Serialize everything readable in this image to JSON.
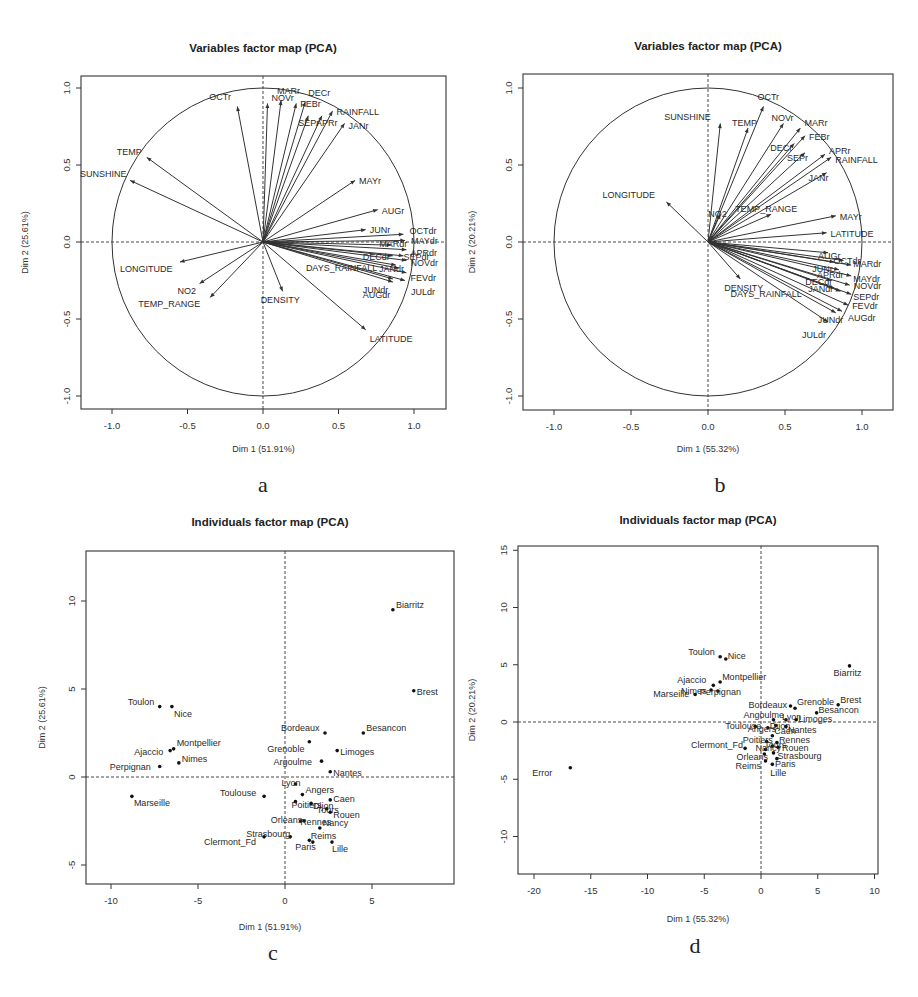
{
  "panels": {
    "a": {
      "letter": "a",
      "title": "Variables factor map (PCA)",
      "xlabel": "Dim 1 (51.91%)",
      "ylabel": "Dim 2 (25.61%)"
    },
    "b": {
      "letter": "b",
      "title": "Variables factor map (PCA)",
      "xlabel": "Dim 1 (55.32%)",
      "ylabel": "Dim 2 (20.21%)"
    },
    "c": {
      "letter": "c",
      "title": "Individuals factor map (PCA)",
      "xlabel": "Dim 1 (51.91%)",
      "ylabel": "Dim 2 (25.61%)"
    },
    "d": {
      "letter": "d",
      "title": "Individuals factor map (PCA)",
      "xlabel": "Dim 1 (55.32%)",
      "ylabel": "Dim 2 (20.21%)"
    }
  },
  "chart_data": [
    {
      "id": "a",
      "type": "scatter",
      "subtype": "variables-correlation-circle",
      "title": "Variables factor map (PCA)",
      "xlabel": "Dim 1 (51.91%)",
      "ylabel": "Dim 2 (25.61%)",
      "xlim": [
        -1.2,
        1.2
      ],
      "ylim": [
        -1.05,
        1.05
      ],
      "xticks": [
        "-1.0",
        "-0.5",
        "0.0",
        "0.5",
        "1.0"
      ],
      "yticks": [
        "-1.0",
        "-0.5",
        "0.0",
        "0.5",
        "1.0"
      ],
      "grid": false,
      "legend": null,
      "points": [
        {
          "label": "OCTr",
          "x": -0.17,
          "y": 0.88
        },
        {
          "label": "NOVr",
          "x": 0.03,
          "y": 0.9
        },
        {
          "label": "MARr",
          "x": 0.12,
          "y": 0.92
        },
        {
          "label": "FEBr",
          "x": 0.22,
          "y": 0.9
        },
        {
          "label": "DECr",
          "x": 0.28,
          "y": 0.91
        },
        {
          "label": "SEPr",
          "x": 0.3,
          "y": 0.82
        },
        {
          "label": "APRr",
          "x": 0.39,
          "y": 0.82
        },
        {
          "label": "RAINFALL",
          "x": 0.46,
          "y": 0.85
        },
        {
          "label": "JANr",
          "x": 0.54,
          "y": 0.77
        },
        {
          "label": "TEMP",
          "x": -0.77,
          "y": 0.55
        },
        {
          "label": "SUNSHINE",
          "x": -0.88,
          "y": 0.4
        },
        {
          "label": "MAYr",
          "x": 0.61,
          "y": 0.4
        },
        {
          "label": "AUGr",
          "x": 0.76,
          "y": 0.21
        },
        {
          "label": "JUNr",
          "x": 0.68,
          "y": 0.08
        },
        {
          "label": "OCTdr",
          "x": 0.93,
          "y": 0.05
        },
        {
          "label": "MAYdr",
          "x": 0.94,
          "y": 0.01
        },
        {
          "label": "MARdr",
          "x": 0.85,
          "y": -0.02
        },
        {
          "label": "APRdr",
          "x": 0.95,
          "y": -0.05
        },
        {
          "label": "DECdr",
          "x": 0.86,
          "y": -0.09
        },
        {
          "label": "SEPdr",
          "x": 0.93,
          "y": -0.09
        },
        {
          "label": "NOVdr",
          "x": 0.95,
          "y": -0.12
        },
        {
          "label": "DAYS_RAINFALL",
          "x": 0.88,
          "y": -0.15
        },
        {
          "label": "JANdr",
          "x": 0.9,
          "y": -0.17
        },
        {
          "label": "FEVdr",
          "x": 0.95,
          "y": -0.2
        },
        {
          "label": "JUNdr",
          "x": 0.86,
          "y": -0.24
        },
        {
          "label": "AUGdr",
          "x": 0.86,
          "y": -0.26
        },
        {
          "label": "JULdr",
          "x": 0.94,
          "y": -0.25
        },
        {
          "label": "LONGITUDE",
          "x": -0.55,
          "y": -0.13
        },
        {
          "label": "NO2",
          "x": -0.42,
          "y": -0.27
        },
        {
          "label": "TEMP_RANGE",
          "x": -0.35,
          "y": -0.36
        },
        {
          "label": "DENSITY",
          "x": 0.13,
          "y": -0.32
        },
        {
          "label": "LATITUDE",
          "x": 0.68,
          "y": -0.57
        }
      ]
    },
    {
      "id": "b",
      "type": "scatter",
      "subtype": "variables-correlation-circle",
      "title": "Variables factor map (PCA)",
      "xlabel": "Dim 1 (55.32%)",
      "ylabel": "Dim 2 (20.21%)",
      "xlim": [
        -1.2,
        1.2
      ],
      "ylim": [
        -1.05,
        1.05
      ],
      "xticks": [
        "-1.0",
        "-0.5",
        "0.0",
        "0.5",
        "1.0"
      ],
      "yticks": [
        "-1.0",
        "-0.5",
        "0.0",
        "0.5",
        "1.0"
      ],
      "grid": false,
      "legend": null,
      "points": [
        {
          "label": "OCTr",
          "x": 0.36,
          "y": 0.88
        },
        {
          "label": "SUNSHINE",
          "x": 0.08,
          "y": 0.77
        },
        {
          "label": "TEMP",
          "x": 0.26,
          "y": 0.74
        },
        {
          "label": "NOVr",
          "x": 0.49,
          "y": 0.77
        },
        {
          "label": "MARr",
          "x": 0.6,
          "y": 0.74
        },
        {
          "label": "FEBr",
          "x": 0.63,
          "y": 0.69
        },
        {
          "label": "DECr",
          "x": 0.56,
          "y": 0.64
        },
        {
          "label": "SEPr",
          "x": 0.63,
          "y": 0.58
        },
        {
          "label": "APRr",
          "x": 0.76,
          "y": 0.57
        },
        {
          "label": "RAINFALL",
          "x": 0.8,
          "y": 0.55
        },
        {
          "label": "JANr",
          "x": 0.77,
          "y": 0.45
        },
        {
          "label": "LONGITUDE",
          "x": -0.27,
          "y": 0.26
        },
        {
          "label": "NO2",
          "x": 0.08,
          "y": 0.18
        },
        {
          "label": "TEMP_RANGE",
          "x": 0.41,
          "y": 0.18
        },
        {
          "label": "MAYr",
          "x": 0.83,
          "y": 0.17
        },
        {
          "label": "LATITUDE",
          "x": 0.77,
          "y": 0.06
        },
        {
          "label": "AUGr",
          "x": 0.78,
          "y": -0.07
        },
        {
          "label": "JUNr",
          "x": 0.82,
          "y": -0.13
        },
        {
          "label": "OCTdr",
          "x": 0.88,
          "y": -0.12
        },
        {
          "label": "MARdr",
          "x": 0.93,
          "y": -0.15
        },
        {
          "label": "APRdr",
          "x": 0.85,
          "y": -0.18
        },
        {
          "label": "MAYdr",
          "x": 0.93,
          "y": -0.22
        },
        {
          "label": "DECdr",
          "x": 0.8,
          "y": -0.25
        },
        {
          "label": "NOVdr",
          "x": 0.92,
          "y": -0.28
        },
        {
          "label": "JANdr",
          "x": 0.82,
          "y": -0.3
        },
        {
          "label": "DAYS_RAINFALL",
          "x": 0.86,
          "y": -0.32
        },
        {
          "label": "SEPdr",
          "x": 0.93,
          "y": -0.34
        },
        {
          "label": "FEVdr",
          "x": 0.91,
          "y": -0.41
        },
        {
          "label": "JUNdr",
          "x": 0.83,
          "y": -0.46
        },
        {
          "label": "AUGdr",
          "x": 0.87,
          "y": -0.45
        },
        {
          "label": "JULdr",
          "x": 0.78,
          "y": -0.52
        },
        {
          "label": "DENSITY",
          "x": 0.21,
          "y": -0.24
        }
      ]
    },
    {
      "id": "c",
      "type": "scatter",
      "subtype": "individuals-map",
      "title": "Individuals factor map (PCA)",
      "xlabel": "Dim 1 (51.91%)",
      "ylabel": "Dim 2 (25.61%)",
      "xlim": [
        -11.5,
        9.5
      ],
      "ylim": [
        -6.2,
        12.8
      ],
      "xticks": [
        "-10",
        "-5",
        "0",
        "5"
      ],
      "yticks": [
        "-5",
        "0",
        "5",
        "10"
      ],
      "grid": false,
      "legend": null,
      "points": [
        {
          "label": "Biarritz",
          "x": 6.2,
          "y": 9.5
        },
        {
          "label": "Brest",
          "x": 7.4,
          "y": 4.9
        },
        {
          "label": "Toulon",
          "x": -7.2,
          "y": 4.0
        },
        {
          "label": "Nice",
          "x": -6.5,
          "y": 4.0
        },
        {
          "label": "Bordeaux",
          "x": 2.3,
          "y": 2.5
        },
        {
          "label": "Besancon",
          "x": 4.5,
          "y": 2.5
        },
        {
          "label": "Grenoble",
          "x": 1.4,
          "y": 2.0
        },
        {
          "label": "Montpellier",
          "x": -6.4,
          "y": 1.6
        },
        {
          "label": "Ajaccio",
          "x": -6.6,
          "y": 1.5
        },
        {
          "label": "Limoges",
          "x": 3.0,
          "y": 1.5
        },
        {
          "label": "Nimes",
          "x": -6.1,
          "y": 0.8
        },
        {
          "label": "Argoulme",
          "x": 2.1,
          "y": 0.9
        },
        {
          "label": "Perpignan",
          "x": -7.2,
          "y": 0.6
        },
        {
          "label": "Nantes",
          "x": 2.6,
          "y": 0.3
        },
        {
          "label": "Lyon",
          "x": 0.6,
          "y": -0.4
        },
        {
          "label": "Angers",
          "x": 1.0,
          "y": -1.0
        },
        {
          "label": "Marseille",
          "x": -8.8,
          "y": -1.1
        },
        {
          "label": "Toulouse",
          "x": -1.2,
          "y": -1.1
        },
        {
          "label": "Caen",
          "x": 2.6,
          "y": -1.3
        },
        {
          "label": "Poitiers",
          "x": 0.6,
          "y": -1.4
        },
        {
          "label": "Dijon",
          "x": 1.5,
          "y": -1.5
        },
        {
          "label": "Tours",
          "x": 2.4,
          "y": -1.8
        },
        {
          "label": "Rouen",
          "x": 2.6,
          "y": -2.0
        },
        {
          "label": "Orleans",
          "x": 0.9,
          "y": -2.5
        },
        {
          "label": "Rennes",
          "x": 1.1,
          "y": -2.5
        },
        {
          "label": "Nancy",
          "x": 2.0,
          "y": -2.9
        },
        {
          "label": "Strasbourg",
          "x": 0.3,
          "y": -3.4
        },
        {
          "label": "Clermont_Fd",
          "x": -1.2,
          "y": -3.4
        },
        {
          "label": "Reims",
          "x": 1.6,
          "y": -3.7
        },
        {
          "label": "Paris",
          "x": 1.4,
          "y": -3.6
        },
        {
          "label": "Lille",
          "x": 2.7,
          "y": -3.7
        }
      ]
    },
    {
      "id": "d",
      "type": "scatter",
      "subtype": "individuals-map",
      "title": "Individuals factor map (PCA)",
      "xlabel": "Dim 1 (55.32%)",
      "ylabel": "Dim 2 (20.21%)",
      "xlim": [
        -21.5,
        10.5
      ],
      "ylim": [
        -13.5,
        15.5
      ],
      "xticks": [
        "-20",
        "-15",
        "-10",
        "-5",
        "0",
        "5",
        "10"
      ],
      "yticks": [
        "-10",
        "-5",
        "0",
        "5",
        "10",
        "15"
      ],
      "grid": false,
      "legend": null,
      "points": [
        {
          "label": "Toulon",
          "x": -3.6,
          "y": 5.7
        },
        {
          "label": "Nice",
          "x": -3.1,
          "y": 5.5
        },
        {
          "label": "Biarritz",
          "x": 7.8,
          "y": 4.9
        },
        {
          "label": "Montpellier",
          "x": -3.6,
          "y": 3.5
        },
        {
          "label": "Ajaccio",
          "x": -4.2,
          "y": 3.2
        },
        {
          "label": "Nimes",
          "x": -4.4,
          "y": 2.8
        },
        {
          "label": "Perpignan",
          "x": -3.8,
          "y": 2.7
        },
        {
          "label": "Marseille",
          "x": -5.8,
          "y": 2.4
        },
        {
          "label": "Bordeaux",
          "x": 2.6,
          "y": 1.4
        },
        {
          "label": "Grenoble",
          "x": 3.0,
          "y": 1.2
        },
        {
          "label": "Brest",
          "x": 6.8,
          "y": 1.5
        },
        {
          "label": "Besancon",
          "x": 4.9,
          "y": 0.8
        },
        {
          "label": "Angoulme",
          "x": 1.1,
          "y": 0.2
        },
        {
          "label": "Lyon",
          "x": 2.2,
          "y": 0.2
        },
        {
          "label": "Limoges",
          "x": 3.1,
          "y": 0.2
        },
        {
          "label": "Toulouse",
          "x": -0.5,
          "y": -0.4
        },
        {
          "label": "Angers",
          "x": 0.6,
          "y": -0.5
        },
        {
          "label": "Dijon",
          "x": 1.3,
          "y": -0.3
        },
        {
          "label": "Nantes",
          "x": 2.2,
          "y": -0.4
        },
        {
          "label": "Caen",
          "x": 1.0,
          "y": -1.2
        },
        {
          "label": "Poitiers",
          "x": 0.5,
          "y": -1.7
        },
        {
          "label": "Rennes",
          "x": 1.4,
          "y": -1.8
        },
        {
          "label": "Tours",
          "x": 1.0,
          "y": -2.1
        },
        {
          "label": "Clermont_Fd",
          "x": -1.4,
          "y": -2.3
        },
        {
          "label": "Nancy",
          "x": 0.4,
          "y": -2.4
        },
        {
          "label": "Rouen",
          "x": 1.5,
          "y": -2.2
        },
        {
          "label": "Orleans",
          "x": 0.3,
          "y": -2.8
        },
        {
          "label": "Strasbourg",
          "x": 1.1,
          "y": -2.7
        },
        {
          "label": "Paris",
          "x": 1.4,
          "y": -3.2
        },
        {
          "label": "Reims",
          "x": 0.4,
          "y": -3.4
        },
        {
          "label": "Lille",
          "x": 1.0,
          "y": -3.7
        },
        {
          "label": "Error",
          "x": -16.8,
          "y": -4.0
        }
      ]
    }
  ]
}
